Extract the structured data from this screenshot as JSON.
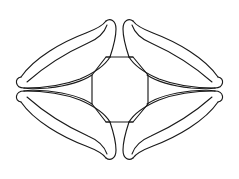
{
  "figure": {
    "background_color": "#ffffff",
    "stroke_color": "#1a1a1a",
    "stroke_width": 1.15,
    "canvas": {
      "width": 239,
      "height": 179
    },
    "center": {
      "x": 119.5,
      "y": 89.5
    },
    "symmetry": "4-fold mirror (horizontal and vertical axes)",
    "parts": [
      {
        "name": "central-octagon",
        "type": "polygon",
        "vertices": [
          [
            106,
            57
          ],
          [
            133,
            57
          ],
          [
            148,
            75
          ],
          [
            148,
            104
          ],
          [
            133,
            122
          ],
          [
            106,
            122
          ],
          [
            92,
            104
          ],
          [
            92,
            75
          ]
        ]
      },
      {
        "name": "petal-top-left",
        "type": "curved-lobe",
        "tip_outer": [
          20,
          90
        ],
        "tip_inner": [
          106,
          22
        ]
      },
      {
        "name": "petal-top-right",
        "type": "curved-lobe",
        "tip_outer": [
          219,
          90
        ],
        "tip_inner": [
          133,
          22
        ]
      },
      {
        "name": "petal-bottom-left",
        "type": "curved-lobe",
        "tip_outer": [
          20,
          90
        ],
        "tip_inner": [
          106,
          157
        ]
      },
      {
        "name": "petal-bottom-right",
        "type": "curved-lobe",
        "tip_outer": [
          219,
          90
        ],
        "tip_inner": [
          133,
          157
        ]
      }
    ],
    "extents": {
      "left": 18,
      "right": 221,
      "top": 20,
      "bottom": 159
    }
  }
}
